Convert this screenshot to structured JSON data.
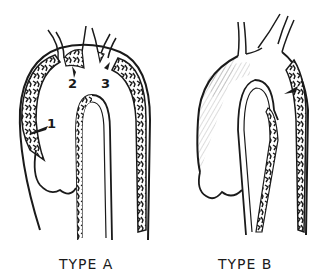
{
  "diagram": {
    "panels": [
      {
        "id": "type-a",
        "caption": "TYPE A",
        "markers": [
          {
            "label": "1",
            "x": 47,
            "y": 116
          },
          {
            "label": "2",
            "x": 68,
            "y": 76
          },
          {
            "label": "3",
            "x": 101,
            "y": 76
          }
        ]
      },
      {
        "id": "type-b",
        "caption": "TYPE B",
        "markers": []
      }
    ],
    "colors": {
      "ink": "#1a1a1a",
      "background": "#ffffff",
      "false_lumen_fill": "#3a3a3a"
    }
  }
}
